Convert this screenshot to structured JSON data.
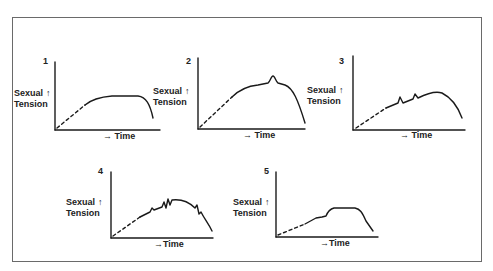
{
  "figure": {
    "panels": [
      {
        "number": "1",
        "ylabel_line1": "Sexual",
        "ylabel_arrow": "↑",
        "ylabel_line2": "Tension",
        "xlabel_arrow": "→",
        "xlabel": "Time",
        "description": "Gradual rise to a sustained plateau, then decline"
      },
      {
        "number": "2",
        "ylabel_line1": "Sexual",
        "ylabel_arrow": "↑",
        "ylabel_line2": "Tension",
        "xlabel_arrow": "→",
        "xlabel": "Time",
        "description": "Rise to plateau with a single brief peak, then decline"
      },
      {
        "number": "3",
        "ylabel_line1": "Sexual",
        "ylabel_arrow": "↑",
        "ylabel_line2": "Tension",
        "xlabel_arrow": "→",
        "xlabel": "Time",
        "description": "Rise with two small peaks before a rounded plateau and decline"
      },
      {
        "number": "4",
        "ylabel_line1": "Sexual",
        "ylabel_arrow": "↑",
        "ylabel_line2": "Tension",
        "xlabel_arrow": "→",
        "xlabel": "Time",
        "description": "Rise with multiple jagged peaks throughout, then decline"
      },
      {
        "number": "5",
        "ylabel_line1": "Sexual",
        "ylabel_arrow": "↑",
        "ylabel_line2": "Tension",
        "xlabel_arrow": "→",
        "xlabel": "Time",
        "description": "Stepwise rise to a flat plateau, then steep decline"
      }
    ]
  },
  "colors": {
    "line": "#1a1a1a",
    "frame": "#6a6a6a",
    "background": "#ffffff"
  }
}
